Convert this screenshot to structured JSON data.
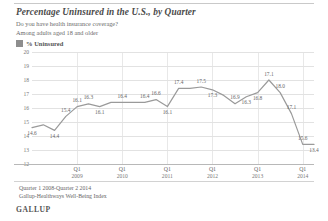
{
  "header": {
    "title": "Percentage Uninsured in the U.S., by Quarter",
    "subtitle1": "Do you have health insurance coverage?",
    "subtitle2": "Among adults aged 18 and older"
  },
  "legend": {
    "label": "% Uninsured",
    "swatch_color": "#8e8e8e"
  },
  "footer": {
    "note1": "Quarter 1 2008-Quarter 2 2014",
    "note2": "Gallup-Healthways Well-Being Index",
    "brand": "GALLUP"
  },
  "chart_data": {
    "type": "line",
    "title": "Percentage Uninsured in the U.S., by Quarter",
    "subtitle": "Do you have health insurance coverage? Among adults aged 18 and older",
    "xlabel": "",
    "ylabel": "",
    "ylim": [
      12,
      20
    ],
    "yticks": [
      12,
      13,
      14,
      15,
      16,
      17,
      18,
      19,
      20
    ],
    "grid": true,
    "legend_position": "top-left",
    "line_color": "#9a9a9a",
    "x_tick_labels": [
      {
        "q": "Q1",
        "yr": "2009",
        "index": 4
      },
      {
        "q": "Q1",
        "yr": "2010",
        "index": 8
      },
      {
        "q": "Q1",
        "yr": "2011",
        "index": 12
      },
      {
        "q": "Q1",
        "yr": "2012",
        "index": 16
      },
      {
        "q": "Q1",
        "yr": "2013",
        "index": 20
      },
      {
        "q": "Q1",
        "yr": "2014",
        "index": 24
      }
    ],
    "categories": [
      "Q1 2008",
      "Q2 2008",
      "Q3 2008",
      "Q4 2008",
      "Q1 2009",
      "Q2 2009",
      "Q3 2009",
      "Q4 2009",
      "Q1 2010",
      "Q2 2010",
      "Q3 2010",
      "Q4 2010",
      "Q1 2011",
      "Q2 2011",
      "Q3 2011",
      "Q4 2011",
      "Q1 2012",
      "Q2 2012",
      "Q3 2012",
      "Q4 2012",
      "Q1 2013",
      "Q2 2013",
      "Q3 2013",
      "Q4 2013",
      "Q1 2014",
      "Q2 2014"
    ],
    "values": [
      14.6,
      14.8,
      14.4,
      15.4,
      16.1,
      16.3,
      16.1,
      16.4,
      16.4,
      16.4,
      16.4,
      16.6,
      16.1,
      17.4,
      17.4,
      17.5,
      17.3,
      16.9,
      16.3,
      16.8,
      17.1,
      18.0,
      17.1,
      15.6,
      13.4,
      13.4
    ],
    "point_labels": [
      {
        "i": 0,
        "text": "14.6",
        "pos": "below"
      },
      {
        "i": 2,
        "text": "14.4",
        "pos": "below"
      },
      {
        "i": 3,
        "text": "15.4",
        "pos": "above"
      },
      {
        "i": 4,
        "text": "16.1",
        "pos": "above"
      },
      {
        "i": 5,
        "text": "16.3",
        "pos": "above"
      },
      {
        "i": 6,
        "text": "16.1",
        "pos": "below"
      },
      {
        "i": 8,
        "text": "16.4",
        "pos": "above"
      },
      {
        "i": 10,
        "text": "16.4",
        "pos": "above"
      },
      {
        "i": 11,
        "text": "16.6",
        "pos": "above"
      },
      {
        "i": 12,
        "text": "16.1",
        "pos": "below"
      },
      {
        "i": 13,
        "text": "17.4",
        "pos": "above"
      },
      {
        "i": 15,
        "text": "17.5",
        "pos": "above"
      },
      {
        "i": 16,
        "text": "17.3",
        "pos": "below"
      },
      {
        "i": 18,
        "text": "16.9",
        "pos": "above"
      },
      {
        "i": 19,
        "text": "16.3",
        "pos": "below"
      },
      {
        "i": 20,
        "text": "16.8",
        "pos": "below"
      },
      {
        "i": 21,
        "text": "17.1",
        "pos": "above"
      },
      {
        "i": 22,
        "text": "18.0",
        "pos": "above"
      },
      {
        "i": 23,
        "text": "17.1",
        "pos": "above"
      },
      {
        "i": 24,
        "text": "15.6",
        "pos": "above"
      },
      {
        "i": 25,
        "text": "13.4",
        "pos": "below"
      }
    ]
  }
}
